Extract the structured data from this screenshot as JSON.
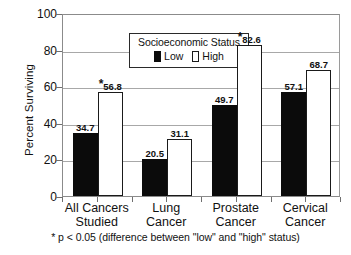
{
  "chart_data": {
    "type": "bar",
    "title": "",
    "xlabel": "",
    "ylabel": "Percent Surviving",
    "ylim": [
      0,
      100
    ],
    "yticks": [
      0,
      20,
      40,
      60,
      80,
      100
    ],
    "grid": true,
    "legend_position": "inside-top-left",
    "categories": [
      "All Cancers\nStudied",
      "Lung\nCancer",
      "Prostate\nCancer",
      "Cervical\nCancer"
    ],
    "series": [
      {
        "name": "Low",
        "color": "#0b0b0b",
        "values": [
          34.7,
          20.5,
          49.7,
          57.1
        ]
      },
      {
        "name": "High",
        "color": "#ffffff",
        "values": [
          56.8,
          31.1,
          82.6,
          68.7
        ]
      }
    ],
    "annotations": [
      {
        "category": "All Cancers Studied",
        "series": "High",
        "marker": "*"
      },
      {
        "category": "Prostate Cancer",
        "series": "High",
        "marker": "*"
      }
    ],
    "footnote": "* p < 0.05 (difference between \"low\" and \"high\" status)"
  },
  "axis": {
    "y_title": "Percent Surviving",
    "y_ticks": [
      "100",
      "80",
      "60",
      "40",
      "20",
      "0"
    ]
  },
  "legend": {
    "title": "Socioeconomic Status",
    "entries": [
      {
        "label": "Low",
        "swatch": "filled-black-square-icon"
      },
      {
        "label": "High",
        "swatch": "outlined-white-square-icon"
      }
    ]
  },
  "categories": [
    {
      "line1": "All Cancers",
      "line2": "Studied"
    },
    {
      "line1": "Lung",
      "line2": "Cancer"
    },
    {
      "line1": "Prostate",
      "line2": "Cancer"
    },
    {
      "line1": "Cervical",
      "line2": "Cancer"
    }
  ],
  "bars": [
    {
      "value": "34.7",
      "star": "",
      "series": "Low"
    },
    {
      "value": "56.8",
      "star": "*",
      "series": "High"
    },
    {
      "value": "20.5",
      "star": "",
      "series": "Low"
    },
    {
      "value": "31.1",
      "star": "",
      "series": "High"
    },
    {
      "value": "49.7",
      "star": "",
      "series": "Low"
    },
    {
      "value": "82.6",
      "star": "*",
      "series": "High"
    },
    {
      "value": "57.1",
      "star": "",
      "series": "Low"
    },
    {
      "value": "68.7",
      "star": "",
      "series": "High"
    }
  ],
  "footnote": "* p < 0.05 (difference between \"low\" and \"high\" status)"
}
